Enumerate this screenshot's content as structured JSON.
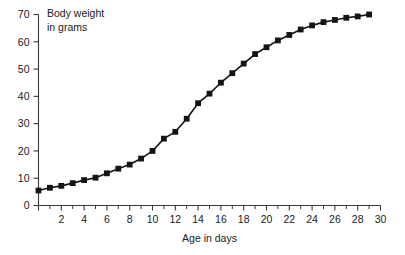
{
  "chart_data": {
    "type": "line",
    "title": "",
    "xlabel": "Age in days",
    "ylabel": "Body weight in grams",
    "ylabel_lines": [
      "Body weight",
      "in grams"
    ],
    "xlim": [
      0,
      30
    ],
    "ylim": [
      0,
      70
    ],
    "x_major_ticks": [
      0,
      2,
      4,
      6,
      8,
      10,
      12,
      14,
      16,
      18,
      20,
      22,
      24,
      26,
      28,
      30
    ],
    "x_tick_labels": [
      "",
      "2",
      "4",
      "6",
      "8",
      "10",
      "12",
      "14",
      "16",
      "18",
      "20",
      "22",
      "24",
      "26",
      "28",
      "30"
    ],
    "x_minor_tick_step": 1,
    "y_major_ticks": [
      0,
      10,
      20,
      30,
      40,
      50,
      60,
      70
    ],
    "y_tick_labels": [
      "0",
      "10",
      "20",
      "30",
      "40",
      "50",
      "60",
      "70"
    ],
    "grid": false,
    "legend": null,
    "marker": "square",
    "marker_color": "#141414",
    "line_color": "#141414",
    "series": [
      {
        "name": "Body weight",
        "x": [
          0,
          1,
          2,
          3,
          4,
          5,
          6,
          7,
          8,
          9,
          10,
          11,
          12,
          13,
          14,
          15,
          16,
          17,
          18,
          19,
          20,
          21,
          22,
          23,
          24,
          25,
          26,
          27,
          28,
          29
        ],
        "values": [
          5.5,
          6.5,
          7.2,
          8.2,
          9.3,
          10.2,
          11.8,
          13.5,
          15.0,
          17.2,
          20.0,
          24.5,
          27.0,
          31.8,
          37.5,
          41.0,
          45.0,
          48.5,
          52.0,
          55.5,
          58.0,
          60.5,
          62.5,
          64.5,
          66.0,
          67.2,
          68.0,
          68.8,
          69.3,
          70.0
        ]
      }
    ]
  },
  "axes": {
    "x_axis_title": "Age in days",
    "y_axis_caption": "Body weight\nin grams"
  },
  "colors": {
    "axis": "#3a3a3a",
    "data": "#141414",
    "background": "#ffffff"
  }
}
